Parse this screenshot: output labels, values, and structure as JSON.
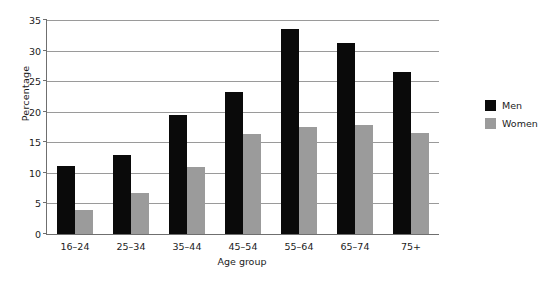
{
  "chart_data": {
    "type": "bar",
    "title": "",
    "xlabel": "Age group",
    "ylabel": "Percentage",
    "categories": [
      "16–24",
      "25–34",
      "35–44",
      "45–54",
      "55–64",
      "65–74",
      "75+"
    ],
    "series": [
      {
        "name": "Men",
        "color": "#0a0a0a",
        "values": [
          11.2,
          12.9,
          19.5,
          23.3,
          33.6,
          31.2,
          26.5
        ]
      },
      {
        "name": "Women",
        "color": "#9b9b9b",
        "values": [
          4.0,
          6.7,
          11.0,
          16.3,
          17.5,
          17.9,
          16.5
        ]
      }
    ],
    "ylim": [
      0,
      35
    ],
    "yticks": [
      0,
      5,
      10,
      15,
      20,
      25,
      30,
      35
    ],
    "ytick_labels": [
      "0",
      "5",
      "10",
      "15",
      "20",
      "25",
      "30",
      "35"
    ],
    "grid": "horizontal",
    "legend_position": "right"
  },
  "legend": {
    "entries": [
      {
        "label": "Men"
      },
      {
        "label": "Women"
      }
    ]
  }
}
